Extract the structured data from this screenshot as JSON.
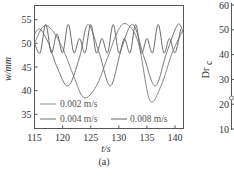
{
  "chart_data": [
    {
      "type": "line",
      "panel_label": "(a)",
      "xlabel": "t/s",
      "ylabel": "w/mm",
      "xlim": [
        115,
        141.5
      ],
      "ylim": [
        32,
        58
      ],
      "xticks": [
        115,
        120,
        125,
        130,
        135,
        140
      ],
      "yticks": [
        35,
        40,
        45,
        50,
        55
      ],
      "grid": false,
      "legend_position": "lower-left inside",
      "series": [
        {
          "name": "0.002 m/s",
          "x": [
            115,
            116.5,
            118,
            120,
            122,
            123.8,
            126,
            128,
            130,
            131.5,
            133.5,
            135.5,
            137.5,
            139.5,
            141.5
          ],
          "values": [
            50,
            53.5,
            53,
            49,
            43,
            38.5,
            41,
            47,
            53,
            54,
            50,
            38,
            41,
            48,
            53
          ]
        },
        {
          "name": "0.004 m/s",
          "x": [
            115,
            116,
            117.5,
            119,
            121,
            123,
            124.5,
            126.5,
            128.5,
            130.5,
            132.5,
            134.5,
            136.5,
            138.5,
            140.5,
            141.5
          ],
          "values": [
            52,
            53,
            50,
            45,
            41,
            47,
            54,
            48,
            41,
            49,
            54,
            47,
            41,
            48,
            54,
            52
          ]
        },
        {
          "name": "0.008 m/s",
          "x": [
            115,
            116,
            117,
            118,
            119,
            120,
            121,
            122,
            123,
            124,
            125,
            126,
            127,
            128,
            129,
            130,
            131,
            132,
            133,
            134,
            135,
            136,
            137,
            138,
            139,
            140,
            141
          ],
          "values": [
            50,
            48,
            54,
            48,
            52,
            48,
            54,
            48,
            51,
            48,
            54,
            48,
            51,
            48,
            54,
            48,
            51,
            48,
            54,
            48,
            51,
            48,
            54,
            48,
            51,
            48,
            53
          ]
        }
      ]
    },
    {
      "type": "line",
      "panel_label": "(b)",
      "ylabel": "Dr_c",
      "yticks": [
        10,
        20,
        30,
        40,
        50,
        60
      ],
      "note": "partially visible panel, cropped at right edge"
    }
  ],
  "labels": {
    "ylabel_a": "w/mm",
    "xlabel_a": "t/s",
    "panel_a": "(a)",
    "ylabel_b": "Dr",
    "ylabel_b_sub": "c",
    "legend": [
      "0.002 m/s",
      "0.004 m/s",
      "0.008 m/s"
    ]
  }
}
